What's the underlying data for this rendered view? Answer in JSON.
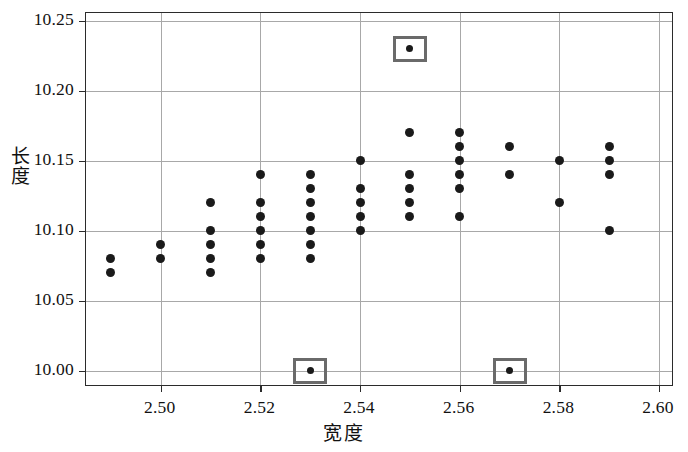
{
  "chart_data": {
    "type": "scatter",
    "title": "",
    "xlabel": "宽度",
    "ylabel": "长度",
    "xlim": [
      2.485,
      2.603
    ],
    "ylim": [
      9.9885,
      10.2555
    ],
    "grid": true,
    "legend": null,
    "xticks": [
      2.5,
      2.52,
      2.54,
      2.56,
      2.58,
      2.6
    ],
    "xticklabels": [
      "2.50",
      "2.52",
      "2.54",
      "2.56",
      "2.58",
      "2.60"
    ],
    "yticks": [
      10.0,
      10.05,
      10.1,
      10.15,
      10.2,
      10.25
    ],
    "yticklabels": [
      "10.00",
      "10.05",
      "10.10",
      "10.15",
      "10.20",
      "10.25"
    ],
    "marker": "filled-circle",
    "marker_color": "#1a1a1a",
    "highlight_style": "gray-square-outline",
    "highlight_color": "#6a6a6a",
    "points": [
      {
        "x": 2.49,
        "y": 10.08,
        "highlighted": false
      },
      {
        "x": 2.49,
        "y": 10.07,
        "highlighted": false
      },
      {
        "x": 2.5,
        "y": 10.09,
        "highlighted": false
      },
      {
        "x": 2.5,
        "y": 10.08,
        "highlighted": false
      },
      {
        "x": 2.51,
        "y": 10.12,
        "highlighted": false
      },
      {
        "x": 2.51,
        "y": 10.1,
        "highlighted": false
      },
      {
        "x": 2.51,
        "y": 10.09,
        "highlighted": false
      },
      {
        "x": 2.51,
        "y": 10.08,
        "highlighted": false
      },
      {
        "x": 2.51,
        "y": 10.07,
        "highlighted": false
      },
      {
        "x": 2.52,
        "y": 10.14,
        "highlighted": false
      },
      {
        "x": 2.52,
        "y": 10.12,
        "highlighted": false
      },
      {
        "x": 2.52,
        "y": 10.11,
        "highlighted": false
      },
      {
        "x": 2.52,
        "y": 10.1,
        "highlighted": false
      },
      {
        "x": 2.52,
        "y": 10.09,
        "highlighted": false
      },
      {
        "x": 2.52,
        "y": 10.08,
        "highlighted": false
      },
      {
        "x": 2.53,
        "y": 10.14,
        "highlighted": false
      },
      {
        "x": 2.53,
        "y": 10.13,
        "highlighted": false
      },
      {
        "x": 2.53,
        "y": 10.12,
        "highlighted": false
      },
      {
        "x": 2.53,
        "y": 10.11,
        "highlighted": false
      },
      {
        "x": 2.53,
        "y": 10.1,
        "highlighted": false
      },
      {
        "x": 2.53,
        "y": 10.09,
        "highlighted": false
      },
      {
        "x": 2.53,
        "y": 10.08,
        "highlighted": false
      },
      {
        "x": 2.53,
        "y": 10.0,
        "highlighted": true
      },
      {
        "x": 2.54,
        "y": 10.15,
        "highlighted": false
      },
      {
        "x": 2.54,
        "y": 10.13,
        "highlighted": false
      },
      {
        "x": 2.54,
        "y": 10.12,
        "highlighted": false
      },
      {
        "x": 2.54,
        "y": 10.11,
        "highlighted": false
      },
      {
        "x": 2.54,
        "y": 10.1,
        "highlighted": false
      },
      {
        "x": 2.55,
        "y": 10.23,
        "highlighted": true
      },
      {
        "x": 2.55,
        "y": 10.17,
        "highlighted": false
      },
      {
        "x": 2.55,
        "y": 10.14,
        "highlighted": false
      },
      {
        "x": 2.55,
        "y": 10.13,
        "highlighted": false
      },
      {
        "x": 2.55,
        "y": 10.12,
        "highlighted": false
      },
      {
        "x": 2.55,
        "y": 10.11,
        "highlighted": false
      },
      {
        "x": 2.56,
        "y": 10.17,
        "highlighted": false
      },
      {
        "x": 2.56,
        "y": 10.16,
        "highlighted": false
      },
      {
        "x": 2.56,
        "y": 10.15,
        "highlighted": false
      },
      {
        "x": 2.56,
        "y": 10.14,
        "highlighted": false
      },
      {
        "x": 2.56,
        "y": 10.13,
        "highlighted": false
      },
      {
        "x": 2.56,
        "y": 10.11,
        "highlighted": false
      },
      {
        "x": 2.57,
        "y": 10.16,
        "highlighted": false
      },
      {
        "x": 2.57,
        "y": 10.14,
        "highlighted": false
      },
      {
        "x": 2.57,
        "y": 10.0,
        "highlighted": true
      },
      {
        "x": 2.58,
        "y": 10.15,
        "highlighted": false
      },
      {
        "x": 2.58,
        "y": 10.12,
        "highlighted": false
      },
      {
        "x": 2.59,
        "y": 10.16,
        "highlighted": false
      },
      {
        "x": 2.59,
        "y": 10.15,
        "highlighted": false
      },
      {
        "x": 2.59,
        "y": 10.14,
        "highlighted": false
      },
      {
        "x": 2.59,
        "y": 10.1,
        "highlighted": false
      }
    ]
  }
}
